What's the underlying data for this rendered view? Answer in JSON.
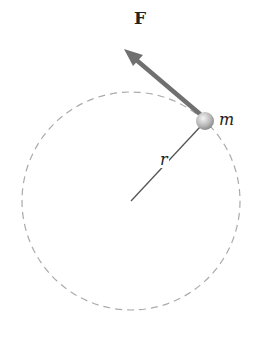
{
  "diagram": {
    "labels": {
      "force": "F",
      "mass": "m",
      "radius": "r"
    },
    "circle": {
      "cx": 131,
      "cy": 201,
      "r": 109,
      "style": "dashed",
      "color": "#aaaaaa"
    },
    "center": {
      "x": 131,
      "y": 201
    },
    "ball": {
      "x": 205,
      "y": 121,
      "r": 9
    },
    "force_vector": {
      "from": [
        202,
        117
      ],
      "to": [
        125,
        51
      ],
      "color": "#707070"
    },
    "colors": {
      "arrow": "#707070",
      "radius_line": "#555555",
      "circle": "#aaaaaa",
      "ball": "#bdbdbd"
    }
  }
}
